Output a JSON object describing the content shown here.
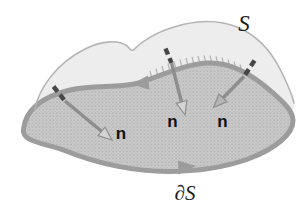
{
  "labels": {
    "surface": "S",
    "boundary": "∂S",
    "normals": [
      "n",
      "n",
      "n"
    ]
  },
  "colors": {
    "background": "#ffffff",
    "surface_top_fill": "#ededed",
    "surface_front_fill": "#cacaca",
    "stipple_dot": "#adadad",
    "boundary_stroke": "#9c9c9c",
    "outline_stroke": "#b4b4b4",
    "arrow_shaft": "#8d8d8d",
    "arrow_head_fill": "#d4d4d4",
    "hidden_segment": "#474747",
    "text": "#1c1c1c"
  }
}
